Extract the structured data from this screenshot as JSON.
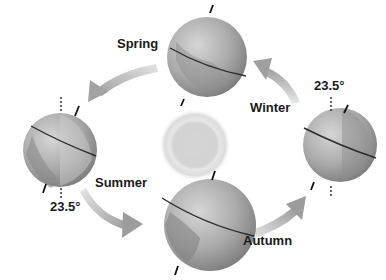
{
  "diagram": {
    "type": "earth-orbit-seasons",
    "center": {
      "name": "Sun",
      "icon": "sun-icon"
    },
    "seasons": [
      {
        "id": "spring",
        "label": "Spring"
      },
      {
        "id": "summer",
        "label": "Summer"
      },
      {
        "id": "autumn",
        "label": "Autumn"
      },
      {
        "id": "winter",
        "label": "Winter"
      }
    ],
    "tilt_labels": [
      {
        "text": "23.5°",
        "position": "right-globe"
      },
      {
        "text": "23.5°",
        "position": "left-globe"
      }
    ],
    "arrow_direction": "counter-clockwise",
    "colors": {
      "background": "#ffffff",
      "globe": "#9a9a9a",
      "arrow": "#b5b5b5",
      "text": "#1a1a1a",
      "sun": "#d8d8d8"
    }
  }
}
